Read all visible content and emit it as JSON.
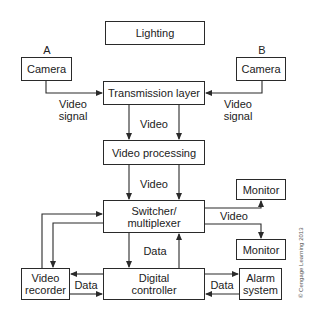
{
  "diagram": {
    "title": "",
    "nodes": {
      "lighting": {
        "label": "Lighting"
      },
      "camera_a": {
        "label": "Camera",
        "tag": "A"
      },
      "camera_b": {
        "label": "Camera",
        "tag": "B"
      },
      "transmission_layer": {
        "label": "Transmission layer"
      },
      "video_processing": {
        "label": "Video processing"
      },
      "switcher": {
        "label": "Switcher/\nmultiplexer"
      },
      "monitor_top": {
        "label": "Monitor"
      },
      "monitor_bottom": {
        "label": "Monitor"
      },
      "video_recorder": {
        "label": "Video\nrecorder"
      },
      "digital_controller": {
        "label": "Digital\ncontroller"
      },
      "alarm_system": {
        "label": "Alarm\nsystem"
      }
    },
    "edge_labels": {
      "camera_a_signal": "Video\nsignal",
      "camera_b_signal": "Video\nsignal",
      "transmission_to_processing": "Video",
      "processing_to_switcher": "Video",
      "switcher_to_monitors": "Video",
      "switcher_controller": "Data",
      "recorder_controller": "Data",
      "controller_alarm": "Data"
    },
    "edges": [
      {
        "from": "camera_a",
        "to": "transmission_layer",
        "label": "Video signal"
      },
      {
        "from": "camera_b",
        "to": "transmission_layer",
        "label": "Video signal"
      },
      {
        "from": "transmission_layer",
        "to": "video_processing",
        "label": "Video",
        "count": 2
      },
      {
        "from": "video_processing",
        "to": "switcher",
        "label": "Video",
        "count": 2
      },
      {
        "from": "switcher",
        "to": "monitor_top",
        "label": "Video"
      },
      {
        "from": "switcher",
        "to": "monitor_bottom",
        "label": "Video"
      },
      {
        "from": "switcher",
        "to": "digital_controller",
        "label": "Data"
      },
      {
        "from": "digital_controller",
        "to": "switcher",
        "label": "Data"
      },
      {
        "from": "switcher",
        "to": "video_recorder"
      },
      {
        "from": "video_recorder",
        "to": "switcher"
      },
      {
        "from": "digital_controller",
        "to": "video_recorder",
        "label": "Data"
      },
      {
        "from": "video_recorder",
        "to": "digital_controller",
        "label": "Data"
      },
      {
        "from": "digital_controller",
        "to": "alarm_system",
        "label": "Data"
      },
      {
        "from": "alarm_system",
        "to": "digital_controller",
        "label": "Data"
      }
    ],
    "copyright": "© Cengage Learning 2013",
    "line_color": "#2a2a2a"
  }
}
